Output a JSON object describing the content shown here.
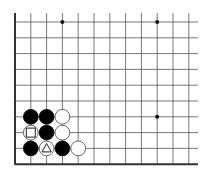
{
  "board": {
    "description": "Go board fragment (lower-left corner view)",
    "columns": 12,
    "rows": 10,
    "origin": {
      "x": 15,
      "y": 22
    },
    "spacing": 15.8,
    "line_color": "#555555",
    "edge_color": "#333333",
    "background": "#ffffff",
    "star_points": [
      {
        "col": 3,
        "row": 0
      },
      {
        "col": 9,
        "row": 0
      },
      {
        "col": 9,
        "row": 6
      }
    ],
    "stones": [
      {
        "col": 1,
        "row": 6,
        "color": "black"
      },
      {
        "col": 2,
        "row": 6,
        "color": "black"
      },
      {
        "col": 3,
        "row": 6,
        "color": "white"
      },
      {
        "col": 1,
        "row": 7,
        "color": "white",
        "marker": "square"
      },
      {
        "col": 2,
        "row": 7,
        "color": "black"
      },
      {
        "col": 3,
        "row": 7,
        "color": "white"
      },
      {
        "col": 1,
        "row": 8,
        "color": "black"
      },
      {
        "col": 2,
        "row": 8,
        "color": "white",
        "marker": "triangle"
      },
      {
        "col": 3,
        "row": 8,
        "color": "black"
      },
      {
        "col": 4,
        "row": 8,
        "color": "white"
      }
    ]
  }
}
